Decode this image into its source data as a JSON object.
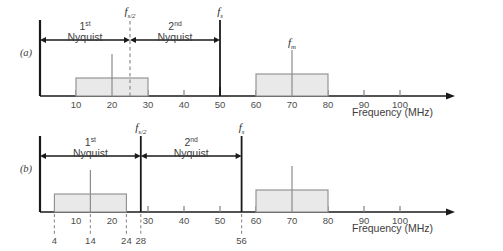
{
  "figure": {
    "background": "#ffffff",
    "box_fill": "#e9e9e9",
    "box_stroke": "#8c8c8c",
    "axis_color": "#1a1a1a"
  },
  "chart_data": {
    "type": "bar",
    "title": "",
    "xlabel": "Frequency (MHz)",
    "ylabel": "",
    "xlim": [
      0,
      115
    ],
    "grid": false,
    "legend": null,
    "panels": [
      {
        "id": "a",
        "label": "(a)",
        "axis_label": "Frequency (MHz)",
        "tick_values": [
          10,
          20,
          30,
          40,
          50,
          60,
          70,
          80,
          90,
          100
        ],
        "tick_labels": [
          "10",
          "20",
          "30",
          "40",
          "50",
          "60",
          "70",
          "80",
          "90",
          "100"
        ],
        "major_ticks": [
          50
        ],
        "bands": [
          {
            "name": "baseband-band",
            "start": 10,
            "end": 30,
            "height": 18
          },
          {
            "name": "image-band",
            "start": 60,
            "end": 80,
            "height": 22
          }
        ],
        "spikes": [
          {
            "name": "baseband-tone",
            "freq": 20,
            "height": 42,
            "label": ""
          },
          {
            "name": "fm-tone",
            "freq": 70,
            "height": 46,
            "label": "f_m",
            "label_text": "f",
            "label_sub": "m"
          }
        ],
        "markers": [
          {
            "name": "fs-half-marker",
            "freq": 25,
            "style": "dashed",
            "label_text": "f",
            "label_sub": "s/2"
          },
          {
            "name": "fs-marker",
            "freq": 50,
            "style": "solid",
            "label_text": "f",
            "label_sub": "s"
          }
        ],
        "spans": [
          {
            "name": "first-nyquist-span",
            "from": 0,
            "to": 25,
            "line1": "1",
            "sup": "st",
            "line2": "Nyquist"
          },
          {
            "name": "second-nyquist-span",
            "from": 25,
            "to": 50,
            "line1": "2",
            "sup": "nd",
            "line2": "Nyquist"
          }
        ],
        "callouts": []
      },
      {
        "id": "b",
        "label": "(b)",
        "axis_label": "Frequency (MHz)",
        "tick_values": [
          10,
          20,
          30,
          40,
          50,
          60,
          70,
          80,
          90,
          100
        ],
        "tick_labels": [
          "10",
          "20",
          "30",
          "40",
          "50",
          "60",
          "70",
          "80",
          "90",
          "100"
        ],
        "major_ticks": [],
        "bands": [
          {
            "name": "baseband-band",
            "start": 4,
            "end": 24,
            "height": 18
          },
          {
            "name": "image-band",
            "start": 60,
            "end": 80,
            "height": 22
          }
        ],
        "spikes": [
          {
            "name": "baseband-tone",
            "freq": 14,
            "height": 42,
            "label": ""
          },
          {
            "name": "fm-tone",
            "freq": 70,
            "height": 46,
            "label": ""
          }
        ],
        "markers": [
          {
            "name": "fs-half-marker",
            "freq": 28,
            "style": "solid",
            "label_text": "f",
            "label_sub": "s/2"
          },
          {
            "name": "fs-marker",
            "freq": 56,
            "style": "solid",
            "label_text": "f",
            "label_sub": "s"
          }
        ],
        "spans": [
          {
            "name": "first-nyquist-span",
            "from": 0,
            "to": 28,
            "line1": "1",
            "sup": "st",
            "line2": "Nyquist"
          },
          {
            "name": "second-nyquist-span",
            "from": 28,
            "to": 56,
            "line1": "2",
            "sup": "nd",
            "line2": "Nyquist"
          }
        ],
        "callouts": [
          {
            "name": "callout-4",
            "freq": 4,
            "label": "4"
          },
          {
            "name": "callout-14",
            "freq": 14,
            "label": "14"
          },
          {
            "name": "callout-24",
            "freq": 24,
            "label": "24"
          },
          {
            "name": "callout-28",
            "freq": 28,
            "label": "28"
          },
          {
            "name": "callout-56",
            "freq": 56,
            "label": "56"
          }
        ]
      }
    ]
  }
}
